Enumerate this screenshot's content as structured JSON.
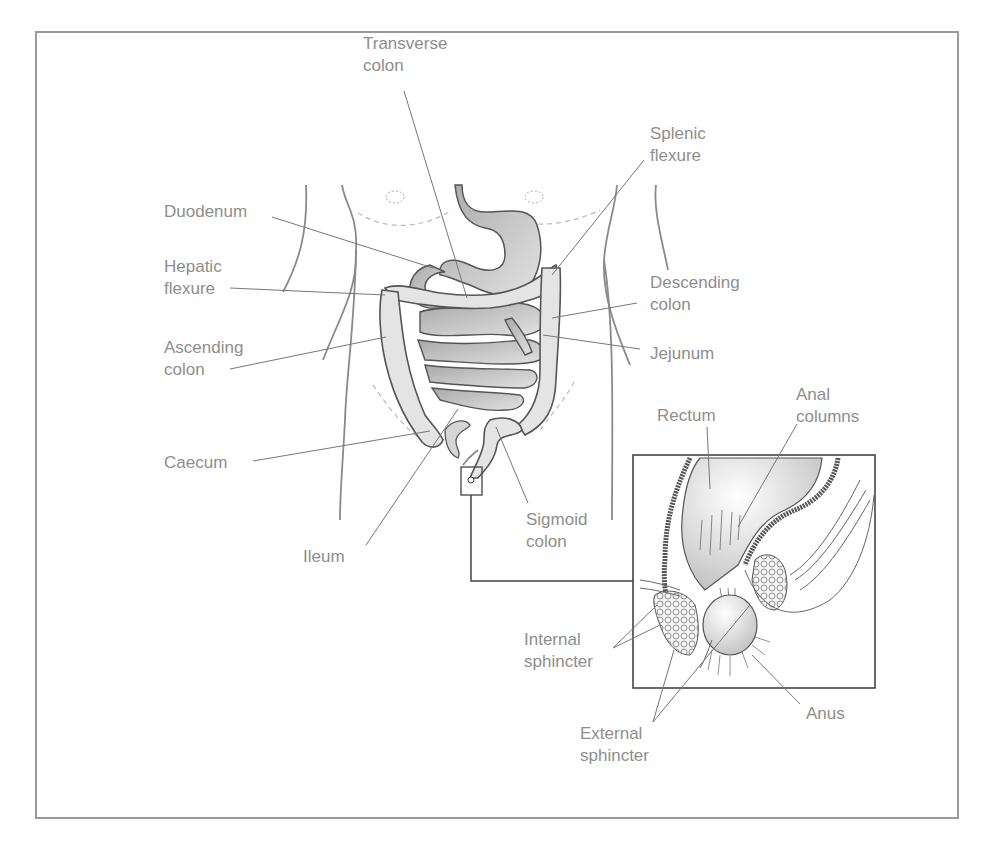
{
  "figure": {
    "colors": {
      "frame": "#9a9a9a",
      "label_text": "#8e8e8e",
      "leader_line": "#777777",
      "organ_fill_light": "#e6e6e6",
      "organ_fill_dark": "#bdbdbd",
      "outline": "#555555"
    }
  },
  "labels": {
    "transverse_colon": "Transverse\ncolon",
    "splenic_flexure": "Splenic\nflexure",
    "duodenum": "Duodenum",
    "hepatic_flexure": "Hepatic\nflexure",
    "descending_colon": "Descending\ncolon",
    "ascending_colon": "Ascending\ncolon",
    "jejunum": "Jejunum",
    "caecum": "Caecum",
    "ileum": "Ileum",
    "sigmoid_colon": "Sigmoid\ncolon",
    "rectum": "Rectum",
    "anal_columns": "Anal\ncolumns",
    "internal_sphincter": "Internal\nsphincter",
    "external_sphincter": "External\nsphincter",
    "anus": "Anus"
  },
  "nipple_marks": [
    "(5)",
    "(5)"
  ]
}
